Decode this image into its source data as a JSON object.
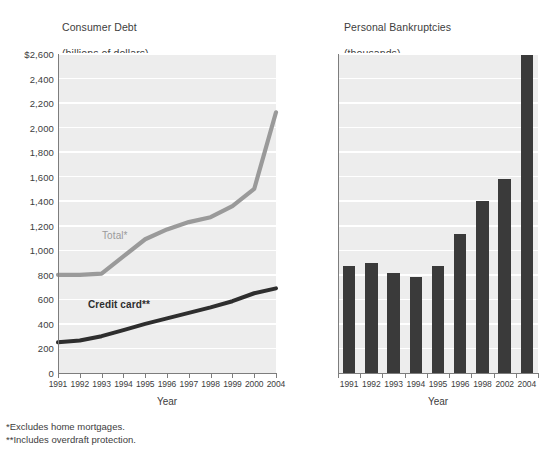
{
  "footnotes": [
    "*Excludes home mortgages.",
    "**Includes overdraft protection."
  ],
  "panels": {
    "left": {
      "title_line1": "Consumer Debt",
      "title_line2": "(billions of dollars)",
      "xlabel": "Year"
    },
    "right": {
      "title_line1": "Personal Bankruptcies",
      "title_line2": "(thousands)",
      "xlabel": "Year"
    }
  },
  "chart_data": [
    {
      "type": "line",
      "title": "Consumer Debt (billions of dollars)",
      "subtitle": "(billions of dollars)",
      "xlabel": "Year",
      "ylabel": "",
      "categories": [
        "1991",
        "1992",
        "1993",
        "1994",
        "1995",
        "1996",
        "1997",
        "1998",
        "1999",
        "2000",
        "2004"
      ],
      "ylim": [
        0,
        2600
      ],
      "ytick_values": [
        0,
        200,
        400,
        600,
        800,
        1000,
        1200,
        1400,
        1600,
        1800,
        2000,
        2200,
        2400,
        2600
      ],
      "ytick_labels": [
        "0",
        "200",
        "400",
        "600",
        "800",
        "1,000",
        "1,200",
        "1,400",
        "1,600",
        "1,800",
        "2,000",
        "2,200",
        "2,400",
        "$2,600"
      ],
      "grid": true,
      "legend_position": "inline-annotation",
      "series": [
        {
          "name": "Total*",
          "color": "#9a9a9a",
          "values": [
            800,
            800,
            810,
            950,
            1090,
            1170,
            1230,
            1270,
            1360,
            1500,
            2125
          ]
        },
        {
          "name": "Credit card**",
          "color": "#2e2e2e",
          "values": [
            250,
            265,
            300,
            350,
            400,
            445,
            490,
            535,
            585,
            650,
            690
          ]
        }
      ],
      "annotations": [
        {
          "text": "Total*",
          "series": "Total*"
        },
        {
          "text": "Credit card**",
          "series": "Credit card**"
        }
      ]
    },
    {
      "type": "bar",
      "title": "Personal Bankruptcies (thousands)",
      "subtitle": "(thousands)",
      "xlabel": "Year",
      "ylabel": "",
      "categories": [
        "1991",
        "1992",
        "1993",
        "1994",
        "1995",
        "1996",
        "1998",
        "2002",
        "2004"
      ],
      "values": [
        870,
        895,
        815,
        780,
        870,
        1130,
        1400,
        1580,
        2590
      ],
      "color": "#3a3a3a",
      "ylim": [
        0,
        2600
      ],
      "ytick_values": [
        0,
        200,
        400,
        600,
        800,
        1000,
        1200,
        1400,
        1600,
        1800,
        2000,
        2200,
        2400,
        2600
      ],
      "ytick_labels": [
        "0",
        "200",
        "400",
        "600",
        "800",
        "1,000",
        "1,200",
        "1,400",
        "1,600",
        "1,800",
        "2,000",
        "2,200",
        "2,400",
        "$2,600"
      ],
      "grid": true
    }
  ]
}
